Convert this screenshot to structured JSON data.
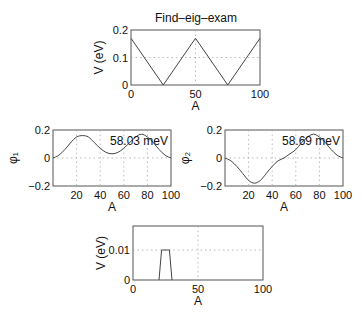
{
  "figure_title": "Find–eig–exam",
  "chart_data": [
    {
      "id": "potential",
      "type": "line",
      "title": "Find–eig–exam",
      "xlabel": "A",
      "ylabel": "V (eV)",
      "xlim": [
        0,
        100
      ],
      "ylim": [
        0,
        0.2
      ],
      "xticks": [
        0,
        50,
        100
      ],
      "yticks": [
        0,
        0.1,
        0.2
      ],
      "ytick_labels": [
        "0",
        "0.1",
        "0.2"
      ],
      "grid": true,
      "x": [
        0,
        25,
        50,
        75,
        100
      ],
      "y": [
        0.17,
        0,
        0.17,
        0,
        0.17
      ],
      "frame": {
        "x": 131,
        "y": 30,
        "w": 129,
        "h": 55
      }
    },
    {
      "id": "phi1",
      "type": "line",
      "title": "",
      "xlabel": "A",
      "ylabel": "φ₁",
      "xlim": [
        0,
        100
      ],
      "ylim": [
        -0.2,
        0.2
      ],
      "xticks": [
        20,
        40,
        60,
        80,
        100
      ],
      "yticks": [
        -0.2,
        0,
        0.2
      ],
      "ytick_labels": [
        "−0.2",
        "0",
        "0.2"
      ],
      "grid": true,
      "annotation": "58.03 meV",
      "x": [
        0,
        5,
        10,
        15,
        20,
        25,
        30,
        35,
        40,
        45,
        50,
        55,
        60,
        65,
        70,
        75,
        80,
        85,
        90,
        95,
        100
      ],
      "y": [
        0.0,
        0.02,
        0.06,
        0.11,
        0.15,
        0.16,
        0.15,
        0.11,
        0.07,
        0.04,
        0.03,
        0.04,
        0.07,
        0.11,
        0.15,
        0.17,
        0.15,
        0.11,
        0.06,
        0.02,
        0.0
      ],
      "frame": {
        "x": 53,
        "y": 130,
        "w": 118,
        "h": 56
      }
    },
    {
      "id": "phi2",
      "type": "line",
      "title": "",
      "xlabel": "A",
      "ylabel": "φ₂",
      "xlim": [
        0,
        100
      ],
      "ylim": [
        -0.2,
        0.2
      ],
      "xticks": [
        20,
        40,
        60,
        80,
        100
      ],
      "yticks": [
        -0.2,
        0,
        0.2
      ],
      "ytick_labels": [
        "−0.2",
        "0",
        "0.2"
      ],
      "grid": true,
      "annotation": "58.69 meV",
      "x": [
        0,
        5,
        10,
        15,
        20,
        25,
        30,
        35,
        40,
        45,
        50,
        55,
        60,
        65,
        70,
        75,
        80,
        85,
        90,
        95,
        100
      ],
      "y": [
        0.0,
        -0.02,
        -0.06,
        -0.11,
        -0.16,
        -0.18,
        -0.16,
        -0.11,
        -0.06,
        -0.02,
        0.0,
        0.03,
        0.06,
        0.11,
        0.15,
        0.17,
        0.15,
        0.11,
        0.06,
        0.02,
        0.0
      ],
      "frame": {
        "x": 225,
        "y": 130,
        "w": 118,
        "h": 56
      }
    },
    {
      "id": "perturbation",
      "type": "line",
      "title": "",
      "xlabel": "A",
      "ylabel": "V (eV)",
      "xlim": [
        0,
        100
      ],
      "ylim": [
        0,
        0.018
      ],
      "xticks": [
        0,
        50,
        100
      ],
      "yticks": [
        0,
        0.01
      ],
      "ytick_labels": [
        "0",
        "0.01"
      ],
      "grid": true,
      "x": [
        20,
        22,
        28,
        30
      ],
      "y": [
        0,
        0.01,
        0.01,
        0
      ],
      "frame": {
        "x": 133,
        "y": 226,
        "w": 130,
        "h": 54
      }
    }
  ],
  "colors": {
    "background": "#ffffff",
    "frame": "#555555",
    "curve": "#444444",
    "grid": "#aaaaaa",
    "text": "#111111"
  }
}
